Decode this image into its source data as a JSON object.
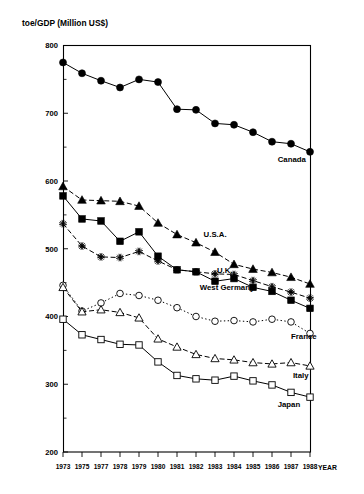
{
  "chart_data": {
    "type": "line",
    "title": "toe/GDP (Million US$)",
    "ylabel": "toe/GDP (Million US$)",
    "xlabel": "YEAR",
    "ylim": [
      200,
      800
    ],
    "ytick_labels": [
      "200",
      "300",
      "400",
      "500",
      "600",
      "700",
      "800"
    ],
    "ytick_values": [
      200,
      300,
      400,
      500,
      600,
      700,
      800
    ],
    "yminor_values": [
      250,
      350,
      450,
      550,
      650,
      750
    ],
    "grid": false,
    "legend_position": "inline-annotations",
    "categories": [
      "1973",
      "1975",
      "1977",
      "1978",
      "1979",
      "1980",
      "1981",
      "1982",
      "1983",
      "1984",
      "1985",
      "1986",
      "1987",
      "1988"
    ],
    "x": [
      1973,
      1975,
      1977,
      1978,
      1979,
      1980,
      1981,
      1982,
      1983,
      1984,
      1985,
      1986,
      1987,
      1988
    ],
    "series": [
      {
        "name": "Canada",
        "marker": "filled-circle",
        "linestyle": "solid",
        "values": [
          775,
          759,
          748,
          738,
          750,
          746,
          706,
          705,
          685,
          683,
          672,
          658,
          655,
          643
        ]
      },
      {
        "name": "U.S.A.",
        "marker": "filled-triangle",
        "linestyle": "dashed",
        "values": [
          592,
          572,
          571,
          570,
          563,
          538,
          521,
          509,
          495,
          477,
          470,
          465,
          458,
          448
        ]
      },
      {
        "name": "U.K.",
        "marker": "filled-square",
        "linestyle": "solid",
        "values": [
          578,
          544,
          541,
          511,
          525,
          489,
          469,
          466,
          452,
          456,
          443,
          437,
          424,
          412
        ]
      },
      {
        "name": "West Germany",
        "marker": "star",
        "linestyle": "dashed",
        "values": [
          537,
          504,
          488,
          487,
          496,
          482,
          469,
          466,
          463,
          462,
          453,
          444,
          436,
          427
        ]
      },
      {
        "name": "France",
        "marker": "open-circle",
        "linestyle": "dotted",
        "values": [
          446,
          408,
          420,
          434,
          431,
          424,
          413,
          400,
          393,
          394,
          392,
          396,
          392,
          375
        ]
      },
      {
        "name": "Italy",
        "marker": "open-triangle",
        "linestyle": "dashed",
        "values": [
          443,
          407,
          410,
          406,
          398,
          367,
          355,
          344,
          338,
          336,
          332,
          330,
          332,
          327
        ]
      },
      {
        "name": "Japan",
        "marker": "open-square",
        "linestyle": "solid",
        "values": [
          396,
          373,
          366,
          359,
          358,
          333,
          313,
          308,
          306,
          312,
          305,
          299,
          288,
          281
        ]
      }
    ],
    "annotations": [
      {
        "text": "Canada",
        "series": "Canada"
      },
      {
        "text": "U.S.A.",
        "series": "U.S.A."
      },
      {
        "text": "U.K.",
        "series": "U.K."
      },
      {
        "text": "West Germany",
        "series": "West Germany"
      },
      {
        "text": "France",
        "series": "France"
      },
      {
        "text": "Italy",
        "series": "Italy"
      },
      {
        "text": "Japan",
        "series": "Japan"
      }
    ]
  },
  "labels": {
    "y_axis_title": "toe/GDP (Million US$)",
    "x_axis_title": "YEAR"
  }
}
